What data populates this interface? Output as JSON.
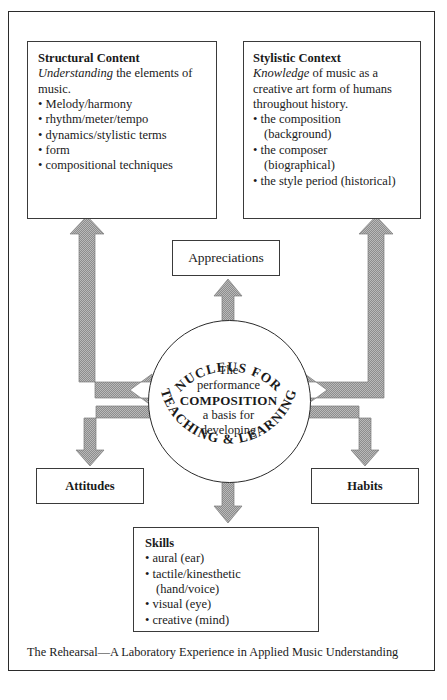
{
  "figure": {
    "caption": "The Rehearsal—A Laboratory Experience in Applied Music Understanding",
    "colors": {
      "ink": "#1a1a1a",
      "border": "#3a3a3a",
      "arrow": "#8a8a8a",
      "background": "#ffffff"
    }
  },
  "boxes": {
    "structural": {
      "title": "Structural Content",
      "lead_italic": "Understanding",
      "lead_rest": " the elements of music.",
      "bullets": [
        "Melody/harmony",
        "rhythm/meter/tempo",
        "dynamics/stylistic terms",
        "form",
        "compositional techniques"
      ]
    },
    "stylistic": {
      "title": "Stylistic Context",
      "lead_italic": "Knowledge",
      "lead_rest": " of music as a creative art form of humans throughout history.",
      "bullets": [
        "the composition",
        "(background)",
        "the composer",
        "(biographical)",
        "the style period (historical)"
      ]
    },
    "appreciations": {
      "label": "Appreciations"
    },
    "attitudes": {
      "label": "Attitudes"
    },
    "habits": {
      "label": "Habits"
    },
    "skills": {
      "title": "Skills",
      "bullets": [
        "aural (ear)",
        "tactile/kinesthetic",
        "(hand/voice)",
        "visual (eye)",
        "creative (mind)"
      ]
    }
  },
  "circle": {
    "arc_top": "NUCLEUS FOR",
    "arc_bottom": "TEACHING & LEARNING",
    "line1": "The",
    "line2": "performance",
    "line3": "COMPOSITION",
    "line4": "a basis for",
    "line5": "developing"
  }
}
